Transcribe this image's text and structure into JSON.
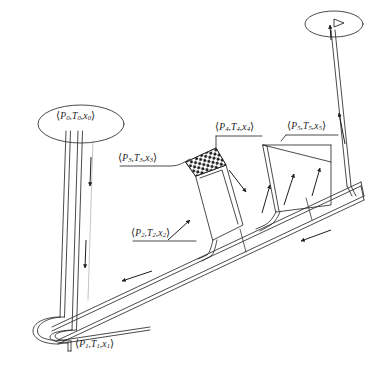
{
  "figure": {
    "background_color": "#ffffff",
    "line_color": "#2b2b2b",
    "hatch_color": "#1a1a1a",
    "width": 378,
    "height": 365
  },
  "state_points": [
    {
      "id": "p0",
      "text": "(P0,T0,x0)",
      "open_paren": "⟨",
      "close_paren": "⟩",
      "pressure": "P",
      "temperature": "T",
      "quality": "x",
      "index": "0",
      "location": "upper-left vessel",
      "x": 56,
      "y": 111
    },
    {
      "id": "p1",
      "text": "(P1,T1,x1)",
      "open_paren": "⟨",
      "close_paren": "⟩",
      "pressure": "P",
      "temperature": "T",
      "quality": "x",
      "index": "1",
      "location": "bottom U-bend return",
      "x": 75,
      "y": 339
    },
    {
      "id": "p2",
      "text": "(P2,T2,x2)",
      "open_paren": "⟨",
      "close_paren": "⟩",
      "pressure": "P",
      "temperature": "T",
      "quality": "x",
      "index": "2",
      "location": "inclined main duct inlet",
      "x": 131,
      "y": 228
    },
    {
      "id": "p3",
      "text": "(P3,T3,x3)",
      "open_paren": "⟨",
      "close_paren": "⟩",
      "pressure": "P",
      "temperature": "T",
      "quality": "x",
      "index": "3",
      "location": "packed bed column top-left",
      "x": 118,
      "y": 153
    },
    {
      "id": "p4",
      "text": "(P4,T4,x4)",
      "open_paren": "⟨",
      "close_paren": "⟩",
      "pressure": "P",
      "temperature": "T",
      "quality": "x",
      "index": "4",
      "location": "packed bed column outlet",
      "x": 215,
      "y": 122
    },
    {
      "id": "p5",
      "text": "(P5,T5,x5)",
      "open_paren": "⟨",
      "close_paren": "⟩",
      "pressure": "P",
      "temperature": "T",
      "quality": "x",
      "index": "5",
      "location": "inclined riser panel outlet",
      "x": 287,
      "y": 121
    }
  ],
  "components": [
    {
      "id": "upper-left-vessel",
      "name": "upper-left-ellipse-vessel",
      "shape": "ellipse",
      "cx": 81,
      "cy": 124,
      "rx": 43,
      "ry": 19
    },
    {
      "id": "upper-right-vessel",
      "name": "upper-right-ellipse-vessel",
      "shape": "ellipse",
      "cx": 334,
      "cy": 24,
      "rx": 29,
      "ry": 13
    },
    {
      "id": "downcomer",
      "name": "vertical-downcomer-pipe",
      "shape": "double-line-pipe"
    },
    {
      "id": "u-bend",
      "name": "bottom-u-bend-return",
      "shape": "rounded-return-bend"
    },
    {
      "id": "main-duct",
      "name": "inclined-main-duct",
      "shape": "inclined-double-duct"
    },
    {
      "id": "packed-column",
      "name": "packed-bed-inclined-column",
      "shape": "inclined-rectangle-with-hatched-band"
    },
    {
      "id": "riser-panel",
      "name": "inclined-riser-panel",
      "shape": "inclined-panel"
    },
    {
      "id": "vertical-riser",
      "name": "vertical-riser-pipe",
      "shape": "double-line-pipe"
    }
  ],
  "flow_arrows": [
    {
      "id": "a1",
      "name": "downcomer-flow-arrow-upper",
      "direction": "down",
      "x": 78,
      "y": 168
    },
    {
      "id": "a2",
      "name": "downcomer-flow-arrow-lower",
      "direction": "down",
      "x": 75,
      "y": 252
    },
    {
      "id": "a3",
      "name": "main-duct-flow-arrow",
      "direction": "left",
      "x": 135,
      "y": 272
    },
    {
      "id": "a4",
      "name": "packed-column-flow-arrow",
      "direction": "up-right",
      "x": 178,
      "y": 232
    },
    {
      "id": "a5",
      "name": "packed-column-outlet-arrow",
      "direction": "down-right",
      "x": 237,
      "y": 180
    },
    {
      "id": "a6",
      "name": "riser-panel-arrow-left",
      "direction": "up",
      "x": 266,
      "y": 196
    },
    {
      "id": "a7",
      "name": "riser-panel-arrow-mid",
      "direction": "up",
      "x": 289,
      "y": 186
    },
    {
      "id": "a8",
      "name": "riser-panel-arrow-right",
      "direction": "up",
      "x": 317,
      "y": 176
    },
    {
      "id": "a9",
      "name": "vertical-riser-arrow",
      "direction": "up",
      "x": 349,
      "y": 120
    },
    {
      "id": "a10",
      "name": "lower-duct-return-arrow",
      "direction": "left",
      "x": 313,
      "y": 237
    },
    {
      "id": "a11",
      "name": "riser-top-arrow",
      "direction": "up",
      "x": 333,
      "y": 28
    }
  ]
}
